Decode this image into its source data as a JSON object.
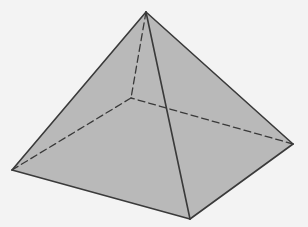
{
  "diagram": {
    "type": "square-pyramid",
    "colors": {
      "background": "#f3f3f3",
      "face_fill": "#b9b9b9",
      "edge": "#3a3a3a"
    },
    "vertices": {
      "apex": [
        146,
        12
      ],
      "left": [
        12,
        170
      ],
      "front": [
        190,
        219
      ],
      "right": [
        293,
        144
      ],
      "back_hidden": [
        131,
        98
      ]
    },
    "visible_edges": [
      [
        "apex",
        "left"
      ],
      [
        "apex",
        "front"
      ],
      [
        "apex",
        "right"
      ],
      [
        "left",
        "front"
      ],
      [
        "front",
        "right"
      ]
    ],
    "hidden_edges": [
      [
        "apex",
        "back_hidden"
      ],
      [
        "left",
        "back_hidden"
      ],
      [
        "right",
        "back_hidden"
      ]
    ]
  }
}
